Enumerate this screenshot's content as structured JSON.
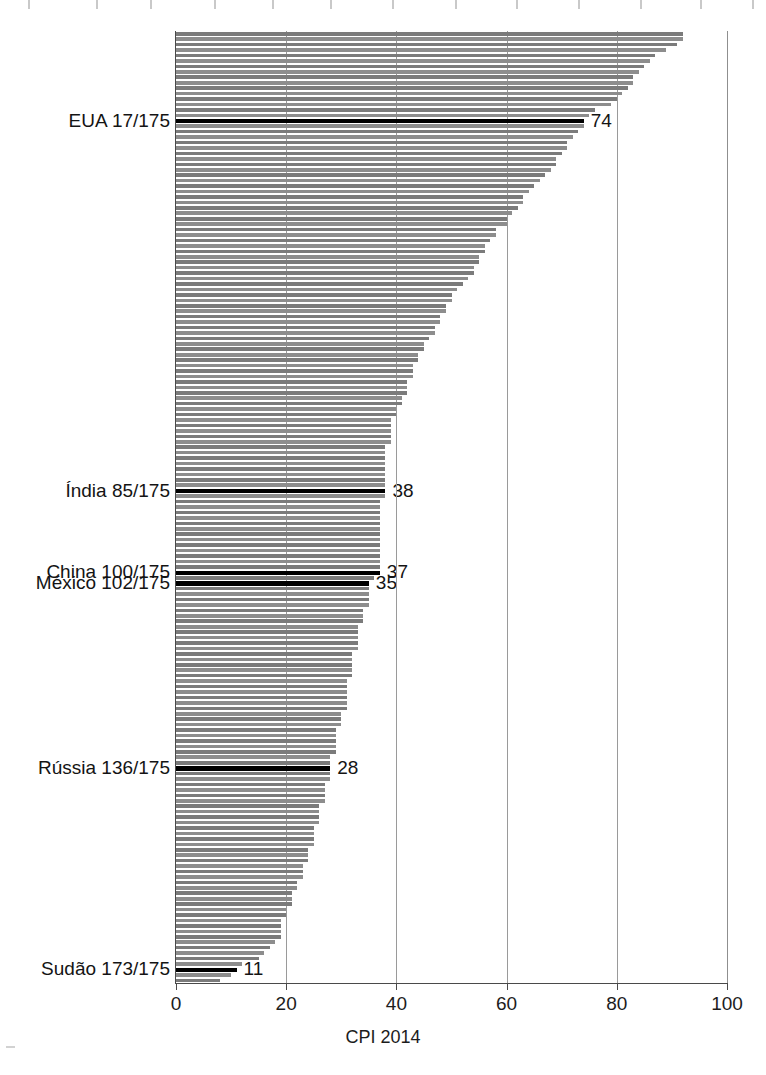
{
  "chart_data": {
    "type": "bar",
    "orientation": "horizontal",
    "title": "",
    "xlabel": "CPI 2014",
    "ylabel": "",
    "xlim": [
      0,
      100
    ],
    "xticks": [
      0,
      20,
      40,
      60,
      80,
      100
    ],
    "xtick_labels": [
      "0",
      "20",
      "40",
      "60",
      "80",
      "100"
    ],
    "grid": "vertical gridlines at 20, 40, 60, 80",
    "legend": "none",
    "n_items": 175,
    "sorted": "descending",
    "bar_color": "#7b7b7b",
    "highlight_color": "#000000",
    "annotations": [
      {
        "label": "EUA 17/175",
        "rank": 17,
        "value": 74,
        "value_text": "74"
      },
      {
        "label": "Índia 85/175",
        "rank": 85,
        "value": 38,
        "value_text": "38"
      },
      {
        "label": "China 100/175",
        "rank": 100,
        "value": 37,
        "value_text": "37"
      },
      {
        "label": "México 102/175",
        "rank": 102,
        "value": 35,
        "value_text": "35"
      },
      {
        "label": "Rússia 136/175",
        "rank": 136,
        "value": 28,
        "value_text": "28"
      },
      {
        "label": "Sudão 173/175",
        "rank": 173,
        "value": 11,
        "value_text": "11"
      }
    ],
    "values": [
      92,
      92,
      91,
      89,
      87,
      86,
      85,
      84,
      83,
      83,
      82,
      81,
      80,
      79,
      76,
      75,
      74,
      74,
      73,
      72,
      71,
      71,
      70,
      69,
      69,
      68,
      67,
      66,
      65,
      64,
      63,
      63,
      62,
      61,
      60,
      60,
      58,
      58,
      57,
      56,
      56,
      55,
      55,
      54,
      54,
      53,
      52,
      51,
      50,
      50,
      49,
      49,
      48,
      48,
      47,
      47,
      46,
      45,
      45,
      44,
      44,
      43,
      43,
      43,
      42,
      42,
      42,
      41,
      41,
      40,
      40,
      39,
      39,
      39,
      39,
      39,
      38,
      38,
      38,
      38,
      38,
      38,
      38,
      38,
      38,
      38,
      37,
      37,
      37,
      37,
      37,
      37,
      37,
      37,
      37,
      37,
      37,
      37,
      37,
      37,
      36,
      35,
      35,
      35,
      35,
      35,
      34,
      34,
      34,
      33,
      33,
      33,
      33,
      33,
      32,
      32,
      32,
      32,
      32,
      31,
      31,
      31,
      31,
      31,
      31,
      30,
      30,
      30,
      29,
      29,
      29,
      29,
      29,
      28,
      28,
      28,
      28,
      28,
      27,
      27,
      27,
      27,
      26,
      26,
      26,
      26,
      25,
      25,
      25,
      25,
      24,
      24,
      24,
      23,
      23,
      23,
      22,
      22,
      21,
      21,
      21,
      20,
      20,
      19,
      19,
      19,
      19,
      18,
      17,
      16,
      15,
      12,
      11,
      10,
      8
    ]
  }
}
